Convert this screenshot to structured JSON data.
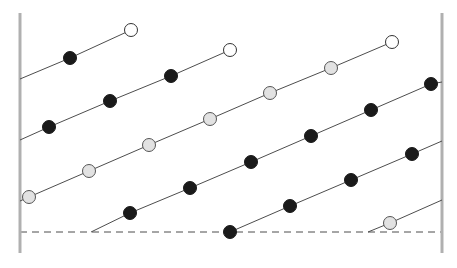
{
  "figure": {
    "title": "",
    "width": 457,
    "height": 268,
    "background_color": "#ffffff"
  },
  "chart_data": {
    "type": "scatter",
    "title": "",
    "xlabel": "",
    "ylabel": "",
    "grid": false,
    "legend": null,
    "axis_ranges": {
      "x": [
        20,
        442
      ],
      "y": [
        20,
        253
      ]
    },
    "marker_styles": {
      "filled": {
        "name": "filled-circle",
        "fill": "#1a1a1a",
        "stroke": "#1a1a1a",
        "radius": 6.5
      },
      "shaded": {
        "name": "shaded-circle",
        "fill": "#e2e2e2",
        "stroke": "#555555",
        "radius": 6.5
      },
      "open": {
        "name": "open-circle",
        "fill": "#ffffff",
        "stroke": "#333333",
        "radius": 6.5
      }
    },
    "line_style": {
      "stroke": "#4d4d4d",
      "width": 1
    },
    "series": [
      {
        "name": "series-1",
        "anchor_start": {
          "x": 20,
          "y": 79
        },
        "anchor_end": null,
        "points": [
          {
            "x": 70,
            "y": 58,
            "marker": "filled"
          },
          {
            "x": 131,
            "y": 30,
            "marker": "open"
          }
        ]
      },
      {
        "name": "series-2",
        "anchor_start": {
          "x": 20,
          "y": 140
        },
        "anchor_end": null,
        "points": [
          {
            "x": 49,
            "y": 127,
            "marker": "filled"
          },
          {
            "x": 110,
            "y": 101,
            "marker": "filled"
          },
          {
            "x": 171,
            "y": 76,
            "marker": "filled"
          },
          {
            "x": 230,
            "y": 50,
            "marker": "open"
          }
        ]
      },
      {
        "name": "series-3",
        "anchor_start": {
          "x": 20,
          "y": 201
        },
        "anchor_end": null,
        "points": [
          {
            "x": 29,
            "y": 197,
            "marker": "shaded"
          },
          {
            "x": 89,
            "y": 171,
            "marker": "shaded"
          },
          {
            "x": 149,
            "y": 145,
            "marker": "shaded"
          },
          {
            "x": 210,
            "y": 119,
            "marker": "shaded"
          },
          {
            "x": 270,
            "y": 93,
            "marker": "shaded"
          },
          {
            "x": 331,
            "y": 68,
            "marker": "shaded"
          },
          {
            "x": 392,
            "y": 42,
            "marker": "open"
          }
        ]
      },
      {
        "name": "series-4",
        "anchor_start": {
          "x": 91,
          "y": 232
        },
        "anchor_end": {
          "x": 442,
          "y": 82
        },
        "points": [
          {
            "x": 130,
            "y": 213,
            "marker": "filled"
          },
          {
            "x": 190,
            "y": 188,
            "marker": "filled"
          },
          {
            "x": 251,
            "y": 162,
            "marker": "filled"
          },
          {
            "x": 311,
            "y": 136,
            "marker": "filled"
          },
          {
            "x": 371,
            "y": 110,
            "marker": "filled"
          },
          {
            "x": 431,
            "y": 84,
            "marker": "filled"
          }
        ]
      },
      {
        "name": "series-5",
        "anchor_start": {
          "x": 230,
          "y": 232
        },
        "anchor_end": {
          "x": 442,
          "y": 141
        },
        "points": [
          {
            "x": 230,
            "y": 232,
            "marker": "filled"
          },
          {
            "x": 290,
            "y": 206,
            "marker": "filled"
          },
          {
            "x": 351,
            "y": 180,
            "marker": "filled"
          },
          {
            "x": 412,
            "y": 154,
            "marker": "filled"
          }
        ]
      },
      {
        "name": "series-6",
        "anchor_start": {
          "x": 368,
          "y": 232
        },
        "anchor_end": {
          "x": 442,
          "y": 200
        },
        "points": [
          {
            "x": 390,
            "y": 223,
            "marker": "shaded"
          }
        ]
      }
    ],
    "reference_lines": [
      {
        "name": "baseline-dashed",
        "orientation": "horizontal",
        "y": 232,
        "x_start": 20,
        "x_end": 442,
        "style": "dashed",
        "color": "#4d4d4d",
        "dash": "7,5"
      },
      {
        "name": "left-boundary",
        "orientation": "vertical",
        "x": 20,
        "y_start": 13,
        "y_end": 253,
        "style": "solid",
        "color": "#b0b0b0",
        "width": 3
      },
      {
        "name": "right-boundary",
        "orientation": "vertical",
        "x": 442,
        "y_start": 13,
        "y_end": 253,
        "style": "solid",
        "color": "#b0b0b0",
        "width": 3
      }
    ]
  }
}
